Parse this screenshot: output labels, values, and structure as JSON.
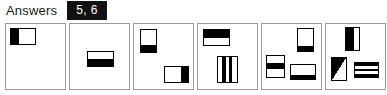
{
  "header": {
    "label": "Answers",
    "answer_chip": "5, 6",
    "chip_bg": "#111111",
    "chip_fg": "#ffffff"
  },
  "panels": [
    {
      "name": "panel-1",
      "shapes": [
        {
          "name": "rect-left-black-third",
          "description": "rectangle, left third filled black"
        }
      ]
    },
    {
      "name": "panel-2",
      "shapes": [
        {
          "name": "rect-bottom-half-black",
          "description": "rectangle, bottom half filled black"
        }
      ]
    },
    {
      "name": "panel-3",
      "shapes": [
        {
          "name": "rect-bottom-third-black",
          "description": "tall rectangle, bottom third filled black"
        },
        {
          "name": "rect-right-third-black",
          "description": "wide rectangle, right third filled black"
        }
      ]
    },
    {
      "name": "panel-4",
      "shapes": [
        {
          "name": "rect-top-band-black",
          "description": "wide rectangle, top band filled black"
        },
        {
          "name": "rect-two-vertical-bars",
          "description": "tall rectangle with two vertical black bars"
        }
      ]
    },
    {
      "name": "panel-5",
      "shapes": [
        {
          "name": "rect-bottom-band-black",
          "description": "tall rectangle, thin bottom band black"
        },
        {
          "name": "rect-middle-band-black",
          "description": "rectangle with black horizontal band across middle"
        },
        {
          "name": "rect-bottom-edge-black",
          "description": "wide rectangle with thick black bottom edge"
        }
      ]
    },
    {
      "name": "panel-6",
      "shapes": [
        {
          "name": "rect-left-black-portion",
          "description": "tall rectangle, left portion filled black"
        },
        {
          "name": "rect-diagonal-triangle",
          "description": "rectangle with black diagonal triangle"
        },
        {
          "name": "rect-horizontal-stripes",
          "description": "wide rectangle with three black horizontal stripes"
        }
      ]
    }
  ]
}
